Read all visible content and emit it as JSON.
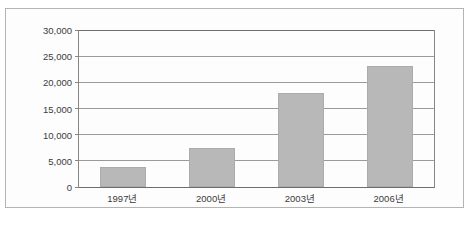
{
  "figure": {
    "title_sliver": "",
    "background_color": "#fdfdfd",
    "frame_color": "#b4b4b4"
  },
  "chart_data": {
    "type": "bar",
    "title": "",
    "subtitle": "",
    "xlabel": "",
    "ylabel": "",
    "categories": [
      "1997년",
      "2000년",
      "2003년",
      "2006년"
    ],
    "values": [
      3800,
      7500,
      18000,
      23200
    ],
    "series": [
      {
        "name": "",
        "values": [
          3800,
          7500,
          18000,
          23200
        ],
        "color": "#b8b8b8"
      }
    ],
    "ylim": [
      0,
      30000
    ],
    "ytick_values": [
      0,
      5000,
      10000,
      15000,
      20000,
      25000,
      30000
    ],
    "ytick_labels": [
      "0",
      "5,000",
      "10,000",
      "15,000",
      "20,000",
      "25,000",
      "30,000"
    ],
    "grid": true,
    "grid_axis": "y",
    "legend": false,
    "legend_position": "none",
    "bar_color": "#b8b8b8",
    "bar_edge_color": "#ababab",
    "axis_color": "#6e6e6e",
    "gridline_color": "#9a9a9a",
    "annotations": []
  }
}
